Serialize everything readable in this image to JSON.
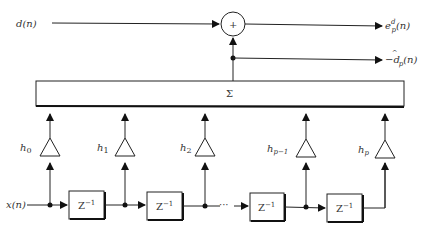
{
  "diagram": {
    "inputs": {
      "desired": "d(n)",
      "signal": "x(n)"
    },
    "outputs": {
      "error": "e",
      "error_sup": "d",
      "error_sub": "p",
      "error_arg": "(n)",
      "estimate_prefix": "−",
      "estimate": "d",
      "estimate_hat": "^",
      "estimate_sub": "p",
      "estimate_arg": "(n)"
    },
    "summer": {
      "symbol": "+"
    },
    "sigma_box": {
      "symbol": "Σ"
    },
    "taps": [
      {
        "label": "h",
        "sub": "0"
      },
      {
        "label": "h",
        "sub": "1"
      },
      {
        "label": "h",
        "sub": "2"
      },
      {
        "label": "h",
        "sub": "p−1"
      },
      {
        "label": "h",
        "sub": "p"
      }
    ],
    "delays": [
      {
        "label": "Z",
        "sup": "−1"
      },
      {
        "label": "Z",
        "sup": "−1"
      },
      {
        "label": "Z",
        "sup": "−1"
      },
      {
        "label": "Z",
        "sup": "−1"
      }
    ],
    "ellipsis": "···"
  }
}
